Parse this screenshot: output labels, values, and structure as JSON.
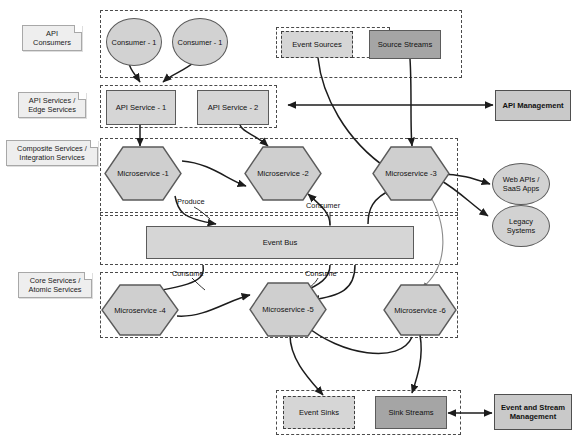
{
  "diagram": {
    "colors": {
      "node_light_gray": "#d6d6d6",
      "node_mid_gray": "#d2d2d2",
      "node_dark_gray": "#a5a5a5",
      "node_stroke": "#5b5b5b",
      "lane_stroke": "#4a4a4a",
      "note_fill": "#eeeeee",
      "edge_stroke": "#1c1c1c",
      "canvas": "#ffffff"
    }
  },
  "lane_notes": [
    {
      "id": "note-api-consumers",
      "label": "API\nConsumers"
    },
    {
      "id": "note-api-services",
      "label": "API Services /\nEdge Services"
    },
    {
      "id": "note-composite-services",
      "label": "Composite Services /\nIntegration Services"
    },
    {
      "id": "note-core-services",
      "label": "Core Services /\nAtomic Services"
    }
  ],
  "lanes": [
    {
      "id": "lane-api-consumers",
      "name": "api-consumers-lane"
    },
    {
      "id": "lane-event-sources",
      "name": "event-sources-lane"
    },
    {
      "id": "lane-api-services",
      "name": "api-services-lane"
    },
    {
      "id": "lane-composite-services",
      "name": "composite-services-lane"
    },
    {
      "id": "lane-event-bus",
      "name": "event-bus-lane"
    },
    {
      "id": "lane-core-services",
      "name": "core-services-lane"
    },
    {
      "id": "lane-event-sinks",
      "name": "event-sinks-lane"
    }
  ],
  "nodes": {
    "consumer_1": "Consumer - 1",
    "consumer_2": "Consumer - 1",
    "event_sources": "Event Sources",
    "source_streams": "Source Streams",
    "api_service_1": "API Service - 1",
    "api_service_2": "API Service - 2",
    "api_management": "API Management",
    "microservice_1": "Microservice -1",
    "microservice_2": "Microservice -2",
    "microservice_3": "Microservice -3",
    "microservice_4": "Microservice -4",
    "microservice_5": "Microservice -5",
    "microservice_6": "Microservice -6",
    "web_apis": "Web APIs /\nSaaS Apps",
    "legacy_systems": "Legacy\nSystems",
    "event_bus": "Event Bus",
    "event_sinks": "Event Sinks",
    "sink_streams": "Sink Streams",
    "event_stream_management": "Event and Stream\nManagement"
  },
  "edge_labels": {
    "produce": "Produce",
    "consumer": "Consumer",
    "consume_left": "Consume",
    "consume_right": "Consume"
  }
}
